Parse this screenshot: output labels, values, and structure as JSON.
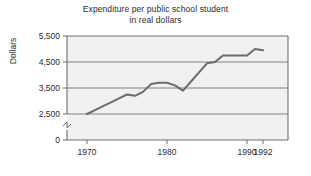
{
  "chart_data": {
    "type": "line",
    "title": "Expenditure per public school student in real dollars",
    "title_lines": [
      "Expenditure per public school student",
      "in real dollars"
    ],
    "xlabel": "",
    "ylabel": "Dollars",
    "x": [
      1970,
      1971,
      1972,
      1973,
      1974,
      1975,
      1976,
      1977,
      1978,
      1979,
      1980,
      1981,
      1982,
      1983,
      1984,
      1985,
      1986,
      1987,
      1988,
      1989,
      1990,
      1991,
      1992
    ],
    "values": [
      2500,
      2650,
      2800,
      2950,
      3100,
      3250,
      3200,
      3350,
      3650,
      3700,
      3700,
      3600,
      3400,
      3750,
      4100,
      4450,
      4500,
      4750,
      4750,
      4750,
      4750,
      5000,
      4950
    ],
    "series": [
      {
        "name": "Expenditure per public school student",
        "values": [
          2500,
          2650,
          2800,
          2950,
          3100,
          3250,
          3200,
          3350,
          3650,
          3700,
          3700,
          3600,
          3400,
          3750,
          4100,
          4450,
          4500,
          4750,
          4750,
          4750,
          4750,
          5000,
          4950
        ],
        "color": "#6b6b6b"
      }
    ],
    "xlim": [
      1968,
      1993
    ],
    "ylim": [
      0,
      5500
    ],
    "y_axis_break": true,
    "y_break_between": [
      0,
      2500
    ],
    "xticks": [
      1970,
      1980,
      1990,
      1992
    ],
    "xtick_labels": [
      "1970",
      "1980",
      "1990",
      "1992"
    ],
    "yticks": [
      0,
      2500,
      3500,
      4500,
      5500
    ],
    "ytick_labels": [
      "0",
      "2,500",
      "3,500",
      "4,500",
      "5,500"
    ],
    "gridlines": true,
    "grid_axis": "y",
    "legend": null,
    "plot_background": "#f0f0f0",
    "grid_color": "#808080",
    "axis_color": "#6e6e6e",
    "line_color": "#6b6b6b"
  }
}
